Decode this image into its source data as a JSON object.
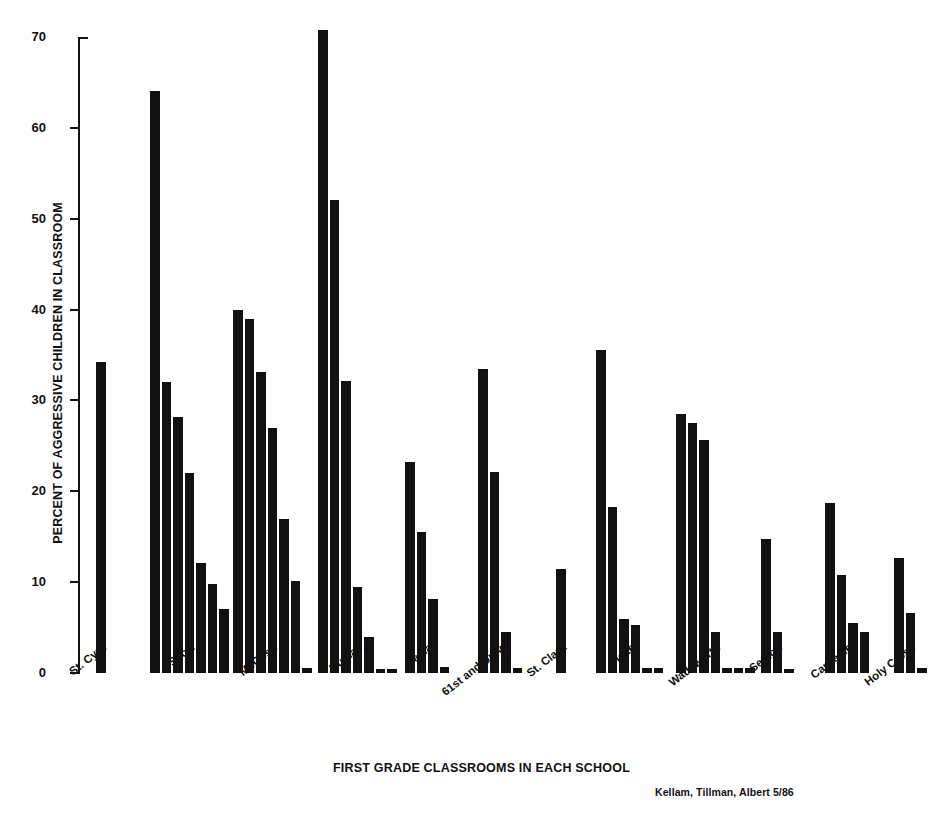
{
  "chart_data": {
    "type": "bar",
    "title": "",
    "xlabel": "FIRST GRADE CLASSROOMS IN EACH SCHOOL",
    "ylabel": "PERCENT OF AGGRESSIVE CHILDREN IN CLASSROOM",
    "ylim": [
      0,
      70
    ],
    "yticks": [
      0,
      10,
      20,
      30,
      40,
      50,
      60,
      70
    ],
    "ytick_labels": [
      "0",
      "10",
      "20",
      "30",
      "40",
      "50",
      "60",
      "70"
    ],
    "grid": false,
    "legend": null,
    "bar_color": "#111111",
    "categories": [
      "St. Cyril",
      "Scott",
      "McCosh",
      "Dumas",
      "Tesla",
      "61st and Univ.",
      "St. Clara",
      "Fiske",
      "Wadsworth",
      "Sexton",
      "Carnegie",
      "Holy Cross"
    ],
    "groups": [
      {
        "label": "St. Cyril",
        "values": [
          34.2
        ]
      },
      {
        "label": "Scott",
        "values": [
          64.1,
          32.0,
          28.2,
          22.0,
          12.1,
          9.8,
          7.0
        ]
      },
      {
        "label": "McCosh",
        "values": [
          40.0,
          39.0,
          33.1,
          27.0,
          17.0,
          10.1,
          0.6
        ]
      },
      {
        "label": "Dumas",
        "values": [
          70.8,
          52.1,
          32.1,
          9.5,
          4.0,
          0.4,
          0.4
        ]
      },
      {
        "label": "Tesla",
        "values": [
          23.2,
          15.5,
          8.2,
          0.7
        ]
      },
      {
        "label": "61st and Univ.",
        "values": [
          33.5,
          22.1,
          4.5,
          0.5
        ]
      },
      {
        "label": "St. Clara",
        "values": [
          11.5
        ]
      },
      {
        "label": "Fiske",
        "values": [
          35.5,
          18.3,
          6.0,
          5.3,
          0.5,
          0.5
        ]
      },
      {
        "label": "Wadsworth",
        "values": [
          28.5,
          27.5,
          25.6,
          4.5,
          0.5,
          0.5,
          0.5
        ]
      },
      {
        "label": "Sexton",
        "values": [
          14.7,
          4.5,
          0.4
        ]
      },
      {
        "label": "Carnegie",
        "values": [
          18.7,
          10.8,
          5.5,
          4.5
        ]
      },
      {
        "label": "Holy Cross",
        "values": [
          12.7,
          6.6,
          0.6
        ]
      }
    ]
  },
  "credit": "Kellam, Tillman, Albert  5/86"
}
